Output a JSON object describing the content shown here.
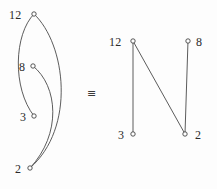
{
  "figure": {
    "background_color": "#fdfdfd",
    "edge_color": "#4a4a4a",
    "node_fill": "#ffffff",
    "node_stroke": "#3a3a3a",
    "relation_symbol": "≡"
  },
  "left_diagram": {
    "name": "curved-embedding",
    "nodes": [
      {
        "id": "12",
        "label": "12",
        "cx": 34,
        "cy": 14,
        "label_x": 9,
        "label_y": 9
      },
      {
        "id": "8",
        "label": "8",
        "cx": 33,
        "cy": 66,
        "label_x": 19,
        "label_y": 61
      },
      {
        "id": "3",
        "label": "3",
        "cx": 34,
        "cy": 116,
        "label_x": 20,
        "label_y": 111
      },
      {
        "id": "2",
        "label": "2",
        "cx": 30,
        "cy": 168,
        "label_x": 15,
        "label_y": 163
      }
    ],
    "edges": [
      {
        "from": "12",
        "to": "3",
        "path": "M 34 14 C 14 34 12 88 34 116"
      },
      {
        "from": "12",
        "to": "2",
        "path": "M 34 14 C 66 44 76 128 30 168"
      },
      {
        "from": "8",
        "to": "2",
        "path": "M 33 66 C 58 86 62 134 30 168"
      }
    ]
  },
  "right_diagram": {
    "name": "straight-line-embedding",
    "nodes": [
      {
        "id": "12",
        "label": "12",
        "cx": 133,
        "cy": 41,
        "label_x": 109,
        "label_y": 36
      },
      {
        "id": "8",
        "label": "8",
        "cx": 188,
        "cy": 41,
        "label_x": 196,
        "label_y": 36
      },
      {
        "id": "3",
        "label": "3",
        "cx": 133,
        "cy": 134,
        "label_x": 118,
        "label_y": 129
      },
      {
        "id": "2",
        "label": "2",
        "cx": 185,
        "cy": 134,
        "label_x": 195,
        "label_y": 129
      }
    ],
    "edges": [
      {
        "from": "12",
        "to": "3",
        "path": "M 133 41 L 133 134"
      },
      {
        "from": "12",
        "to": "2",
        "path": "M 133 41 L 185 134"
      },
      {
        "from": "8",
        "to": "2",
        "path": "M 188 41 L 185 134"
      }
    ]
  },
  "relation": {
    "symbol": "≡",
    "x": 87,
    "y": 88
  }
}
